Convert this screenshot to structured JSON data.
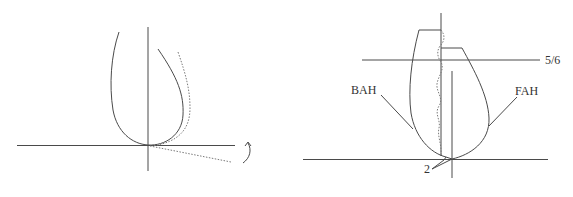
{
  "colors": {
    "background": "#ffffff",
    "stroke": "#4a4a4a",
    "dotted": "#7a7a7a",
    "text": "#333333"
  },
  "left_figure": {
    "description": "Tooth profile at the origin with a dotted rotated profile and a rotation arrow",
    "elements": [
      "horizontal-axis",
      "vertical-axis",
      "solid-profile",
      "dotted-rotated-profile",
      "dotted-rotated-baseline",
      "rotation-arrow"
    ]
  },
  "right_figure": {
    "labels": {
      "level": "5/6",
      "back_flank": "BAH",
      "front_flank": "FAH",
      "contact": "2"
    }
  }
}
